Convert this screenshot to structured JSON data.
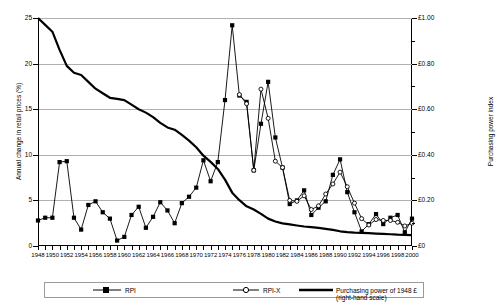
{
  "chart_data": {
    "type": "line",
    "title": "",
    "xlabel": "",
    "ylabel": "Annual change in retail prices (%)",
    "ylabel_right": "Purchasing power index",
    "xlim": [
      1948,
      2000
    ],
    "ylim": [
      0,
      25
    ],
    "ylim_right": [
      0,
      1.0
    ],
    "grid": true,
    "legend_position": "bottom",
    "x": [
      1948,
      1949,
      1950,
      1951,
      1952,
      1953,
      1954,
      1955,
      1956,
      1957,
      1958,
      1959,
      1960,
      1961,
      1962,
      1963,
      1964,
      1965,
      1966,
      1967,
      1968,
      1969,
      1970,
      1971,
      1972,
      1973,
      1974,
      1975,
      1976,
      1977,
      1978,
      1979,
      1980,
      1981,
      1982,
      1983,
      1984,
      1985,
      1986,
      1987,
      1988,
      1989,
      1990,
      1991,
      1992,
      1993,
      1994,
      1995,
      1996,
      1997,
      1998,
      1999,
      2000
    ],
    "xticklabels": [
      "1948",
      "1950",
      "1952",
      "1954",
      "1956",
      "1958",
      "1960",
      "1962",
      "1964",
      "1966",
      "1968",
      "1970",
      "1972",
      "1974",
      "1976",
      "1978",
      "1980",
      "1982",
      "1984",
      "1986",
      "1988",
      "1990",
      "1992",
      "1994",
      "1996",
      "1998",
      "2000"
    ],
    "yticklabels_left": [
      "0",
      "5",
      "10",
      "15",
      "20",
      "25"
    ],
    "yticks_left": [
      0,
      5,
      10,
      15,
      20,
      25
    ],
    "yticklabels_right": [
      "£0",
      "£0.20",
      "£0.40",
      "£0.60",
      "£0.80",
      "£1.00"
    ],
    "yticks_right": [
      0,
      0.2,
      0.4,
      0.6,
      0.8,
      1.0
    ],
    "series": [
      {
        "name": "RPI",
        "marker": "filled-square",
        "axis": "left",
        "values": [
          2.8,
          3.1,
          3.1,
          9.2,
          9.3,
          3.1,
          1.8,
          4.5,
          4.9,
          3.7,
          3.0,
          0.6,
          1.0,
          3.4,
          4.3,
          2.0,
          3.2,
          4.8,
          3.9,
          2.5,
          4.7,
          5.4,
          6.4,
          9.4,
          7.1,
          9.2,
          16.0,
          24.2,
          16.5,
          15.8,
          8.3,
          13.4,
          18.0,
          11.9,
          8.6,
          4.6,
          5.0,
          6.1,
          3.4,
          4.2,
          4.9,
          7.8,
          9.5,
          5.9,
          3.7,
          1.6,
          2.4,
          3.5,
          2.4,
          3.1,
          3.4,
          1.5,
          3.0
        ]
      },
      {
        "name": "RPI-X",
        "marker": "open-circle",
        "axis": "left",
        "values": [
          null,
          null,
          null,
          null,
          null,
          null,
          null,
          null,
          null,
          null,
          null,
          null,
          null,
          null,
          null,
          null,
          null,
          null,
          null,
          null,
          null,
          null,
          null,
          null,
          null,
          null,
          null,
          null,
          16.6,
          15.6,
          8.3,
          17.2,
          14.0,
          9.3,
          8.6,
          5.0,
          4.9,
          5.5,
          4.0,
          4.4,
          5.7,
          6.8,
          8.1,
          6.5,
          4.7,
          3.0,
          2.3,
          2.9,
          2.8,
          2.8,
          2.6,
          2.2,
          2.5
        ]
      },
      {
        "name": "Purchasing power of 1948 £ (right-hand scale)",
        "marker": "none",
        "axis": "right",
        "values": [
          1.0,
          0.97,
          0.94,
          0.86,
          0.79,
          0.76,
          0.75,
          0.72,
          0.69,
          0.67,
          0.65,
          0.645,
          0.64,
          0.62,
          0.6,
          0.585,
          0.565,
          0.54,
          0.52,
          0.51,
          0.487,
          0.462,
          0.433,
          0.396,
          0.369,
          0.338,
          0.291,
          0.234,
          0.201,
          0.174,
          0.16,
          0.141,
          0.12,
          0.1075,
          0.099,
          0.0945,
          0.09,
          0.0855,
          0.0825,
          0.0795,
          0.0755,
          0.0705,
          0.0645,
          0.0608,
          0.0586,
          0.0577,
          0.0563,
          0.0545,
          0.0532,
          0.0516,
          0.0499,
          0.0491,
          0.0477
        ]
      }
    ]
  },
  "legend": {
    "items": [
      {
        "label": "RPI",
        "marker": "filled-square"
      },
      {
        "label": "RPI-X",
        "marker": "open-circle"
      },
      {
        "label": "Purchasing power of 1948 £ (right-hand scale)",
        "marker": "thick-line"
      }
    ]
  }
}
